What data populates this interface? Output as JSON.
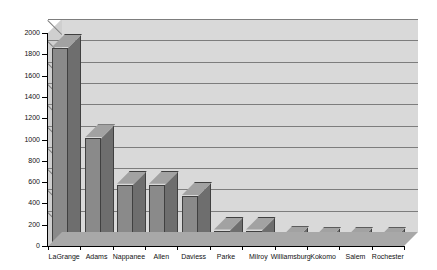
{
  "chart_data": {
    "type": "bar",
    "title": "",
    "xlabel": "",
    "ylabel": "",
    "ylim": [
      0,
      2000
    ],
    "ytick_step": 200,
    "yticks": [
      0,
      200,
      400,
      600,
      800,
      1000,
      1200,
      1400,
      1600,
      1800,
      2000
    ],
    "grid": true,
    "legend": "none",
    "style": "3d-column",
    "categories": [
      "LaGrange",
      "Adams",
      "Nappanee",
      "Allen",
      "Daviess",
      "Parke",
      "Milroy",
      "Williamsburg",
      "Kokomo",
      "Salem",
      "Rochester"
    ],
    "values": [
      1860,
      1010,
      575,
      575,
      470,
      145,
      145,
      55,
      45,
      45,
      45
    ]
  },
  "colors": {
    "bar_front": "#8a8a8a",
    "bar_side": "#6e6e6e",
    "bar_top": "#a2a2a2",
    "bar_outline": "#404040",
    "back_wall": "#d9d9d9",
    "left_wall": "#cfcfcf",
    "top_face": "#e0e0e0",
    "floor": "#a8a8a8",
    "gridline": "#7d7d7d",
    "axis": "#000000",
    "page_background": "#ffffff"
  }
}
